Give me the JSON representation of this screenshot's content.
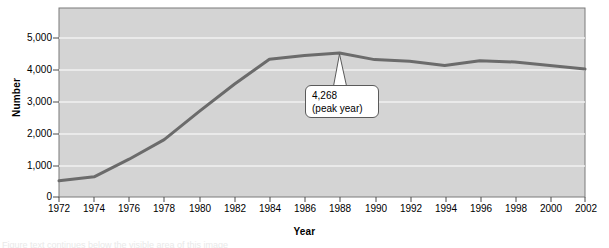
{
  "chart_data": {
    "type": "line",
    "title": "",
    "xlabel": "Year",
    "ylabel": "Number",
    "x": [
      1972,
      1974,
      1976,
      1978,
      1980,
      1982,
      1984,
      1986,
      1988,
      1990,
      1992,
      1994,
      1996,
      1998,
      2000,
      2002
    ],
    "values": [
      480,
      600,
      1120,
      1700,
      2540,
      3340,
      4080,
      4190,
      4268,
      4070,
      4020,
      3900,
      4040,
      4000,
      3900,
      3790
    ],
    "series": [
      {
        "name": "Number",
        "values": [
          480,
          600,
          1120,
          1700,
          2540,
          3340,
          4080,
          4190,
          4268,
          4070,
          4020,
          3900,
          4040,
          4000,
          3900,
          3790
        ]
      }
    ],
    "xlim": [
      1972,
      2002
    ],
    "ylim": [
      0,
      5600
    ],
    "yticks": [
      0,
      1000,
      2000,
      3000,
      4000,
      5000
    ],
    "ytick_labels": [
      "0",
      "1,000",
      "2,000",
      "3,000",
      "4,000",
      "5,000"
    ],
    "xticks": [
      1972,
      1974,
      1976,
      1978,
      1980,
      1982,
      1984,
      1986,
      1988,
      1990,
      1992,
      1994,
      1996,
      1998,
      2000,
      2002
    ],
    "xtick_labels": [
      "1972",
      "1974",
      "1976",
      "1978",
      "1980",
      "1982",
      "1984",
      "1986",
      "1988",
      "1990",
      "1992",
      "1994",
      "1996",
      "1998",
      "2000",
      "2002"
    ],
    "grid": true,
    "grid_axis": "y",
    "legend": false,
    "plot_background": "#d4d4d4",
    "line_color": "#6b6b6b",
    "grid_color": "#f2f2f2",
    "annotations": [
      {
        "name": "peak-callout",
        "line1": "4,268",
        "line2": "(peak year)",
        "target_x": 1988,
        "target_y": 4268
      }
    ]
  },
  "caption": {
    "text": "Figure text continues below the visible area of this image"
  }
}
